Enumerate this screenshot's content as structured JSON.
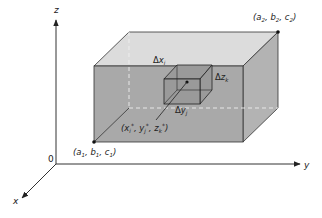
{
  "diagram": {
    "axes": {
      "x_label": "x",
      "y_label": "y",
      "z_label": "z",
      "origin_label": "0"
    },
    "box": {
      "corner_min_label": {
        "a": "a",
        "a_sub": "1",
        "b": "b",
        "b_sub": "1",
        "c": "c",
        "c_sub": "1"
      },
      "corner_max_label": {
        "a": "a",
        "a_sub": "2",
        "b": "b",
        "b_sub": "2",
        "c": "c",
        "c_sub": "2"
      },
      "colors": {
        "front_face": "#a9a9a9",
        "top_face": "#dcdcdc",
        "right_face": "#b3b3b3",
        "edge": "#333333"
      }
    },
    "sub_box": {
      "delta_x": {
        "delta": "Δ",
        "var": "x",
        "sub": "i"
      },
      "delta_y": {
        "delta": "Δ",
        "var": "y",
        "sub": "j"
      },
      "delta_z": {
        "delta": "Δ",
        "var": "z",
        "sub": "k"
      },
      "sample_point": {
        "x": "x",
        "x_sub": "i",
        "y": "y",
        "y_sub": "j",
        "z": "z",
        "z_sub": "k",
        "star": "*"
      },
      "colors": {
        "fill": "#9a9a9a",
        "edge": "#222222"
      }
    }
  }
}
